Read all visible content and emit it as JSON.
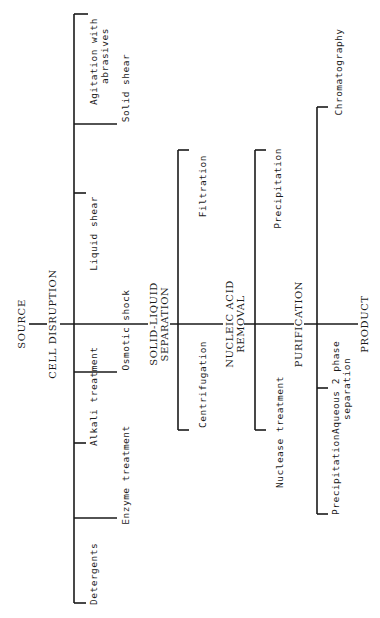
{
  "diagram": {
    "type": "process-flow-tree",
    "orientation": "rotated-90-ccw",
    "stages": [
      {
        "label_lines": [
          "SOURCE"
        ]
      },
      {
        "label_lines": [
          "CELL DISRUPTION"
        ]
      },
      {
        "label_lines": [
          "SOLID-LIQUID",
          "SEPARATION"
        ]
      },
      {
        "label_lines": [
          "NUCLEIC ACID",
          "REMOVAL"
        ]
      },
      {
        "label_lines": [
          "PURIFICATION"
        ]
      },
      {
        "label_lines": [
          "PRODUCT"
        ]
      }
    ],
    "branches": {
      "cell_disruption": {
        "above": [
          {
            "label_lines": [
              "Agitation with",
              "abrasives"
            ]
          },
          {
            "label_lines": [
              "Solid shear"
            ]
          },
          {
            "label_lines": [
              "Liquid shear"
            ]
          }
        ],
        "below": [
          {
            "label_lines": [
              "Osmotic shock"
            ]
          },
          {
            "label_lines": [
              "Alkali treatment"
            ]
          },
          {
            "label_lines": [
              "Enzyme treatment"
            ]
          },
          {
            "label_lines": [
              "Detergents"
            ]
          }
        ]
      },
      "solid_liquid_separation": {
        "above": [
          {
            "label_lines": [
              "Filtration"
            ]
          }
        ],
        "below": [
          {
            "label_lines": [
              "Centrifugation"
            ]
          }
        ]
      },
      "nucleic_acid_removal": {
        "above": [
          {
            "label_lines": [
              "Precipitation"
            ]
          }
        ],
        "below": [
          {
            "label_lines": [
              "Nuclease treatment"
            ]
          }
        ]
      },
      "purification": {
        "above": [
          {
            "label_lines": [
              "Chromatography"
            ]
          }
        ],
        "below": [
          {
            "label_lines": [
              "Aqueous 2 phase",
              "separation"
            ]
          },
          {
            "label_lines": [
              "Precipitation"
            ]
          }
        ]
      }
    }
  }
}
